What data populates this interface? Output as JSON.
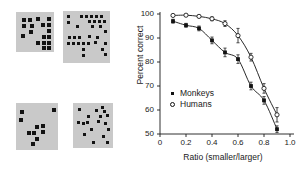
{
  "figure": {
    "stimuli": {
      "name": "dot-array-stimuli",
      "panels": [
        {
          "id": "panel-top-left",
          "label": "top-left dot array",
          "count": 17,
          "box": {
            "x": 16,
            "y": 12,
            "w": 38,
            "h": 40
          },
          "dot_size": 4.0,
          "dots": [
            [
              6,
              6
            ],
            [
              12,
              6
            ],
            [
              20,
              5
            ],
            [
              31,
              5
            ],
            [
              6,
              12
            ],
            [
              14,
              12
            ],
            [
              25,
              11
            ],
            [
              31,
              11
            ],
            [
              13,
              18
            ],
            [
              31,
              17
            ],
            [
              5,
              22
            ],
            [
              26,
              23
            ],
            [
              31,
              23
            ],
            [
              20,
              29
            ],
            [
              26,
              29
            ],
            [
              31,
              29
            ],
            [
              26,
              34
            ],
            [
              31,
              34
            ]
          ]
        },
        {
          "id": "panel-top-right",
          "label": "top-right dot array",
          "count": 30,
          "box": {
            "x": 63,
            "y": 11,
            "w": 47,
            "h": 52
          },
          "dot_size": 3.4,
          "dots": [
            [
              4,
              4
            ],
            [
              17,
              4
            ],
            [
              22,
              4
            ],
            [
              27,
              4
            ],
            [
              32,
              4
            ],
            [
              37,
              4
            ],
            [
              4,
              10
            ],
            [
              25,
              9
            ],
            [
              30,
              9
            ],
            [
              35,
              9
            ],
            [
              40,
              9
            ],
            [
              13,
              14
            ],
            [
              28,
              14
            ],
            [
              36,
              14
            ],
            [
              41,
              19
            ],
            [
              5,
              25
            ],
            [
              10,
              25
            ],
            [
              15,
              25
            ],
            [
              25,
              24
            ],
            [
              33,
              25
            ],
            [
              4,
              31
            ],
            [
              9,
              31
            ],
            [
              14,
              31
            ],
            [
              19,
              31
            ],
            [
              24,
              31
            ],
            [
              31,
              30
            ],
            [
              41,
              31
            ],
            [
              19,
              37
            ],
            [
              38,
              37
            ],
            [
              19,
              43
            ],
            [
              41,
              42
            ]
          ]
        },
        {
          "id": "panel-bottom-left",
          "label": "bottom-left dot array",
          "count": 11,
          "box": {
            "x": 16,
            "y": 103,
            "w": 42,
            "h": 47
          },
          "dot_size": 4.4,
          "dots": [
            [
              4,
              7
            ],
            [
              36,
              5
            ],
            [
              3,
              15
            ],
            [
              19,
              22
            ],
            [
              25,
              21
            ],
            [
              11,
              28
            ],
            [
              16,
              28
            ],
            [
              25,
              27
            ],
            [
              19,
              34
            ],
            [
              15,
              39
            ]
          ]
        },
        {
          "id": "panel-bottom-right",
          "label": "bottom-right dot array",
          "count": 17,
          "box": {
            "x": 73,
            "y": 103,
            "w": 40,
            "h": 45
          },
          "dot_size": 2.8,
          "dots": [
            [
              5,
              5
            ],
            [
              22,
              6
            ],
            [
              28,
              3
            ],
            [
              30,
              7
            ],
            [
              14,
              12
            ],
            [
              26,
              12
            ],
            [
              33,
              11
            ],
            [
              4,
              18
            ],
            [
              9,
              19
            ],
            [
              13,
              18
            ],
            [
              24,
              17
            ],
            [
              31,
              19
            ],
            [
              17,
              25
            ],
            [
              34,
              25
            ],
            [
              10,
              30
            ],
            [
              29,
              32
            ],
            [
              19,
              38
            ],
            [
              33,
              38
            ]
          ]
        }
      ]
    },
    "chart_data": {
      "type": "line",
      "title": "",
      "xlabel": "Ratio (smaller/larger)",
      "ylabel": "Percent correct",
      "xlim": [
        0,
        1.0
      ],
      "ylim": [
        50,
        100
      ],
      "xticks": [
        0,
        0.2,
        0.4,
        0.6,
        0.8,
        1.0
      ],
      "xticklabels": [
        "0",
        "0.2",
        "0.4",
        "0.6",
        "0.8",
        "1.0"
      ],
      "yticks": [
        50,
        60,
        70,
        80,
        90,
        100
      ],
      "yticklabels": [
        "50",
        "60",
        "70",
        "80",
        "90",
        "100"
      ],
      "grid": false,
      "legend_position": "lower-left-inside",
      "x": [
        0.1,
        0.2,
        0.3,
        0.4,
        0.5,
        0.6,
        0.7,
        0.8,
        0.9
      ],
      "series": [
        {
          "name": "Monkeys",
          "marker": "filled-square",
          "color": "#121212",
          "values": [
            97.0,
            95.3,
            94.0,
            89.0,
            84.0,
            81.2,
            70.0,
            64.0,
            52.0
          ],
          "errors": [
            0.8,
            0.8,
            1.0,
            1.4,
            1.8,
            1.8,
            1.6,
            1.6,
            1.4
          ]
        },
        {
          "name": "Humans",
          "marker": "open-circle",
          "color": "#121212",
          "values": [
            99.4,
            99.5,
            99.0,
            98.0,
            96.0,
            91.0,
            82.0,
            69.0,
            58.0
          ],
          "errors": [
            0.4,
            0.4,
            0.5,
            0.8,
            1.2,
            3.0,
            1.6,
            2.0,
            3.0
          ]
        }
      ]
    },
    "legend": {
      "items": [
        {
          "marker": "filled-square",
          "label": "Monkeys"
        },
        {
          "marker": "open-circle",
          "label": "Humans"
        }
      ]
    }
  }
}
